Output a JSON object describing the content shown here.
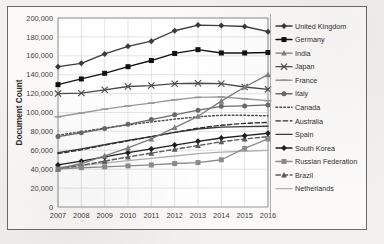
{
  "chart_data": {
    "type": "line",
    "title": "",
    "xlabel": "",
    "ylabel": "Document Count",
    "x": [
      2007,
      2008,
      2009,
      2010,
      2011,
      2012,
      2013,
      2014,
      2015,
      2016
    ],
    "xtick_labels": [
      "2007",
      "2008",
      "2009",
      "2010",
      "2011",
      "2012",
      "2013",
      "2014",
      "2015",
      "2016"
    ],
    "ytick_labels": [
      "0",
      "20,000",
      "40,000",
      "60,000",
      "80,000",
      "100,000",
      "120,000",
      "140,000",
      "160,000",
      "180,000",
      "200,000"
    ],
    "ytick_values": [
      0,
      20000,
      40000,
      60000,
      80000,
      100000,
      120000,
      140000,
      160000,
      180000,
      200000
    ],
    "ylim": [
      0,
      200000
    ],
    "grid": true,
    "legend_position": "right",
    "series": [
      {
        "name": "United Kingdom",
        "marker": "diamond",
        "line": "solid",
        "color": "#3a3a3a",
        "values": [
          148500,
          152000,
          162000,
          170000,
          175500,
          186500,
          192500,
          192000,
          191000,
          185500
        ]
      },
      {
        "name": "Germany",
        "marker": "square",
        "line": "solid",
        "color": "#111111",
        "values": [
          129500,
          135500,
          141500,
          148500,
          155000,
          162500,
          166500,
          163000,
          163000,
          163500
        ]
      },
      {
        "name": "India",
        "marker": "triangle",
        "line": "solid",
        "color": "#7d7d7d",
        "values": [
          40500,
          46000,
          54000,
          62500,
          72000,
          84000,
          96000,
          112000,
          127000,
          140000
        ]
      },
      {
        "name": "Japan",
        "marker": "cross",
        "line": "solid",
        "color": "#4a4a4a",
        "values": [
          120000,
          120500,
          124000,
          127500,
          128500,
          130500,
          131000,
          130500,
          127000,
          124500
        ]
      },
      {
        "name": "France",
        "marker": "dash",
        "line": "solid",
        "color": "#9a9a9a",
        "values": [
          95500,
          99500,
          103500,
          107000,
          110000,
          113500,
          116000,
          116500,
          114500,
          112500
        ]
      },
      {
        "name": "Italy",
        "marker": "circle",
        "line": "solid",
        "color": "#6a6a6a",
        "values": [
          74500,
          78500,
          83000,
          87500,
          92500,
          97500,
          102500,
          106500,
          107000,
          108000
        ]
      },
      {
        "name": "Canada",
        "marker": "none",
        "line": "dotted",
        "color": "#4e4e4e",
        "values": [
          76000,
          79500,
          83500,
          87000,
          90000,
          93000,
          95500,
          97000,
          97000,
          96500
        ]
      },
      {
        "name": "Australia",
        "marker": "none",
        "line": "dashed",
        "color": "#2f2f2f",
        "values": [
          56500,
          60500,
          65500,
          70000,
          74500,
          79000,
          83500,
          86500,
          88500,
          89500
        ]
      },
      {
        "name": "Spain",
        "marker": "none",
        "line": "solid",
        "color": "#3c3c3c",
        "values": [
          57500,
          61500,
          66000,
          70500,
          74500,
          79000,
          82500,
          84500,
          85000,
          85500
        ]
      },
      {
        "name": "South Korea",
        "marker": "diamond",
        "line": "solid",
        "color": "#202020",
        "values": [
          44500,
          48500,
          53000,
          57500,
          61500,
          65500,
          69500,
          73000,
          75500,
          78000
        ]
      },
      {
        "name": "Russian Federation",
        "marker": "square",
        "line": "solid",
        "color": "#8c8c8c",
        "values": [
          40500,
          41500,
          42500,
          43500,
          44500,
          46000,
          47000,
          50000,
          62000,
          72000
        ]
      },
      {
        "name": "Brazil",
        "marker": "triangle",
        "line": "dashed",
        "color": "#5a5a5a",
        "values": [
          40000,
          44000,
          48500,
          53000,
          57000,
          61000,
          65000,
          69000,
          72000,
          74500
        ]
      },
      {
        "name": "Netherlands",
        "marker": "none",
        "line": "solid",
        "color": "#b0b0b0",
        "values": [
          42000,
          44000,
          46500,
          49000,
          51500,
          54000,
          56500,
          58000,
          59000,
          60000
        ]
      }
    ]
  }
}
